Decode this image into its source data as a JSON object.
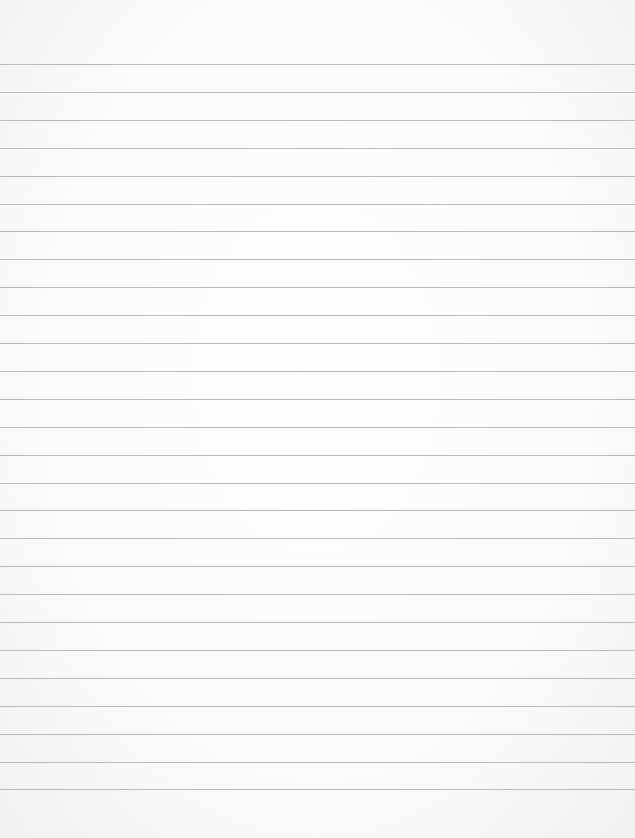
{
  "page": {
    "type": "lined-paper",
    "background_color": "#fcfcfc",
    "line_color": "#b9b9b9",
    "first_line_y": 64,
    "line_spacing": 27.9,
    "line_count": 27
  }
}
